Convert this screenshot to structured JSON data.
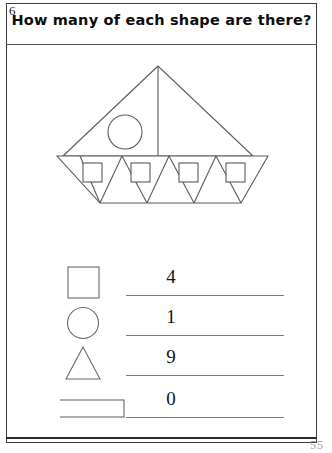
{
  "worksheet": {
    "exercise_number": "6",
    "question": "How many of each shape are there?",
    "page_number": "55"
  },
  "figure": {
    "name": "sailboat-composite-shape",
    "stroke_color": "#5a5a5a",
    "fill_color": "#ffffff"
  },
  "answers": [
    {
      "shape": "square",
      "shape_icon": "square-outline-icon",
      "value": "4"
    },
    {
      "shape": "circle",
      "shape_icon": "circle-outline-icon",
      "value": "1"
    },
    {
      "shape": "triangle",
      "shape_icon": "triangle-outline-icon",
      "value": "9"
    },
    {
      "shape": "rectangle",
      "shape_icon": "rectangle-outline-icon",
      "value": "0"
    }
  ]
}
